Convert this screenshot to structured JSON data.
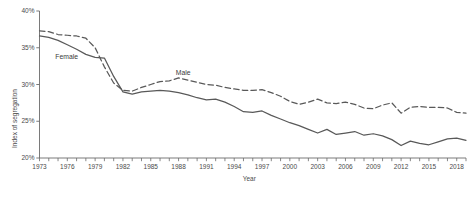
{
  "chart_data": {
    "type": "line",
    "title": "",
    "xlabel": "Year",
    "ylabel": "Index of segregation",
    "xlim": [
      1973,
      2019
    ],
    "ylim": [
      20,
      40
    ],
    "ytick_labels": [
      "20%",
      "25%",
      "30%",
      "35%",
      "40%"
    ],
    "ytick_values": [
      20,
      25,
      30,
      35,
      40
    ],
    "xtick_labels": [
      "1973",
      "1976",
      "1979",
      "1982",
      "1985",
      "1988",
      "1991",
      "1994",
      "1997",
      "2000",
      "2003",
      "2006",
      "2009",
      "2012",
      "2015",
      "2018"
    ],
    "xtick_values": [
      1973,
      1976,
      1979,
      1982,
      1985,
      1988,
      1991,
      1994,
      1997,
      2000,
      2003,
      2006,
      2009,
      2012,
      2015,
      2018
    ],
    "minor_ticks_every": 1,
    "grid": false,
    "legend_position": "inline-annotations",
    "x": [
      1973,
      1974,
      1975,
      1976,
      1977,
      1978,
      1979,
      1980,
      1981,
      1982,
      1983,
      1984,
      1985,
      1986,
      1987,
      1988,
      1989,
      1990,
      1991,
      1992,
      1993,
      1994,
      1995,
      1996,
      1997,
      1998,
      1999,
      2000,
      2001,
      2002,
      2003,
      2004,
      2005,
      2006,
      2007,
      2008,
      2009,
      2010,
      2011,
      2012,
      2013,
      2014,
      2015,
      2016,
      2017,
      2018,
      2019
    ],
    "series": [
      {
        "name": "Male",
        "style": "dashed",
        "color": "#595959",
        "label_x": 1989,
        "label_y": 31.6,
        "values": [
          37.3,
          37.2,
          36.8,
          36.7,
          36.6,
          36.3,
          35.0,
          32.4,
          30.2,
          29.2,
          29.1,
          29.6,
          30.0,
          30.4,
          30.5,
          30.9,
          30.6,
          30.3,
          30.0,
          29.9,
          29.6,
          29.4,
          29.2,
          29.2,
          29.3,
          28.9,
          28.4,
          27.7,
          27.3,
          27.6,
          28.0,
          27.5,
          27.4,
          27.6,
          27.3,
          26.8,
          26.7,
          27.2,
          27.5,
          26.1,
          26.9,
          27.0,
          26.9,
          26.9,
          26.8,
          26.2,
          26.1
        ]
      },
      {
        "name": "Female",
        "style": "solid",
        "color": "#595959",
        "label_x": 1976,
        "label_y": 33.7,
        "values": [
          36.6,
          36.4,
          36.0,
          35.4,
          34.8,
          34.1,
          33.7,
          33.6,
          31.1,
          29.0,
          28.7,
          29.0,
          29.1,
          29.2,
          29.1,
          28.9,
          28.6,
          28.2,
          27.9,
          28.0,
          27.6,
          27.0,
          26.3,
          26.2,
          26.4,
          25.8,
          25.3,
          24.8,
          24.4,
          23.9,
          23.4,
          23.9,
          23.2,
          23.4,
          23.6,
          23.1,
          23.3,
          23.0,
          22.5,
          21.7,
          22.3,
          22.0,
          21.8,
          22.2,
          22.6,
          22.7,
          22.4
        ]
      }
    ]
  },
  "axis_titles": {
    "x": "Year",
    "y": "Index of segregation"
  },
  "annotations": [
    {
      "text": "Female"
    },
    {
      "text": "Male"
    }
  ]
}
